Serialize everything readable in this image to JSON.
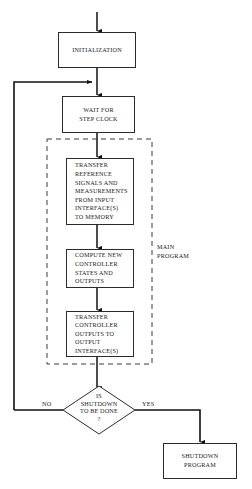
{
  "diagram": {
    "colors": {
      "stroke": "#2b2b2b",
      "line": "#111111",
      "dashed": "#3a3a3a",
      "background": "#ffffff",
      "text": "#1a1a1a"
    },
    "nodes": {
      "initialization": {
        "label": "INITIALIZATION",
        "shape": "rectangle"
      },
      "wait_for_step_clock": {
        "label": "WAIT FOR\nSTEP CLOCK",
        "shape": "rectangle"
      },
      "transfer_reference": {
        "label": "TRANSFER\nREFERENCE\nSIGNALS AND\nMEASUREMENTS\nFROM INPUT\nINTERFACE(S)\nTO MEMORY",
        "shape": "rectangle"
      },
      "compute_controller": {
        "label": "COMPUTE NEW\nCONTROLLER\nSTATES AND\nOUTPUTS",
        "shape": "rectangle"
      },
      "transfer_outputs": {
        "label": "TRANSFER\nCONTROLLER\nOUTPUTS TO\nOUTPUT\nINTERFACE(S)",
        "shape": "rectangle"
      },
      "shutdown_decision": {
        "label": "IS\nSHUTDOWN\nTO BE DONE\n?",
        "shape": "diamond"
      },
      "shutdown_program": {
        "label": "SHUTDOWN\nPROGRAM",
        "shape": "rectangle"
      }
    },
    "group": {
      "main_program": {
        "label": "MAIN\nPROGRAM",
        "style": "dashed"
      }
    },
    "edge_labels": {
      "no": "NO",
      "yes": "YES"
    }
  }
}
